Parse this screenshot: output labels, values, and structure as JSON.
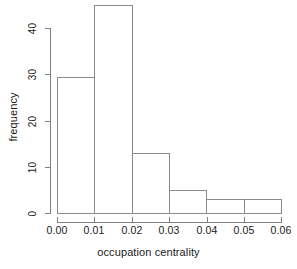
{
  "chart_data": {
    "type": "bar",
    "title": "",
    "subtitle": "",
    "xlabel": "occupation centrality",
    "ylabel": "frequency",
    "xlim": [
      0.0,
      0.06
    ],
    "ylim": [
      0,
      45
    ],
    "grid": false,
    "legend": null,
    "bin_width": 0.01,
    "bin_edges": [
      0.0,
      0.01,
      0.02,
      0.03,
      0.04,
      0.05,
      0.06
    ],
    "categories": [
      "0.00-0.01",
      "0.01-0.02",
      "0.02-0.03",
      "0.03-0.04",
      "0.04-0.05",
      "0.05-0.06"
    ],
    "values": [
      29.5,
      45,
      13,
      5,
      3,
      3
    ],
    "x_tick_labels": [
      "0.00",
      "0.01",
      "0.02",
      "0.03",
      "0.04",
      "0.05",
      "0.06"
    ],
    "x_tick_values": [
      0.0,
      0.01,
      0.02,
      0.03,
      0.04,
      0.05,
      0.06
    ],
    "y_tick_labels": [
      "0",
      "10",
      "20",
      "30",
      "40"
    ],
    "y_tick_values": [
      0,
      10,
      20,
      30,
      40
    ],
    "bar_fill": "#ffffff",
    "bar_stroke": "#8a8a8a",
    "axis_color": "#808080",
    "text_color": "#1a1a1a",
    "background": "#ffffff"
  }
}
